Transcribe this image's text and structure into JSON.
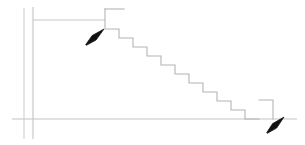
{
  "canvas": {
    "width": 305,
    "height": 145,
    "background": "#ffffff"
  },
  "drawing": {
    "title": "Staircase section line drawing",
    "line_color": "#c8c8c8",
    "line_color_dark": "#b4b4b4",
    "arrow_color": "#111111",
    "line_width": 1,
    "description": "Thin grey architectural section showing a stair flight descending left to right, with two solid black pointer arrows"
  },
  "guides": {
    "vertical_left": {
      "x": 24,
      "y1": 8,
      "y2": 139,
      "color": "#cfcfcf"
    },
    "vertical_right": {
      "x": 33,
      "y1": 7,
      "y2": 139,
      "color": "#c4c4c4"
    },
    "baseline": {
      "x1": 12,
      "x2": 297,
      "y": 119,
      "color": "#c4c4c4"
    },
    "landing_line": {
      "x1": 33,
      "x2": 105,
      "y": 20,
      "color": "#c8c8c8"
    }
  },
  "stair": {
    "step_count": 11,
    "tread_width": 14,
    "riser_height": 9,
    "top_landing": {
      "x1": 105,
      "x2": 124,
      "y": 9
    },
    "top_riser": {
      "x": 105,
      "y1": 9,
      "y2": 29
    },
    "start": {
      "x": 105,
      "y": 29
    },
    "end": {
      "x": 273,
      "y": 119
    },
    "points": [
      [
        105,
        9
      ],
      [
        124,
        9
      ],
      [
        105,
        9
      ],
      [
        105,
        29
      ],
      [
        119,
        29
      ],
      [
        119,
        38
      ],
      [
        133,
        38
      ],
      [
        133,
        47
      ],
      [
        147,
        47
      ],
      [
        147,
        56
      ],
      [
        161,
        56
      ],
      [
        161,
        64
      ],
      [
        175,
        64
      ],
      [
        175,
        73
      ],
      [
        189,
        73
      ],
      [
        189,
        82
      ],
      [
        203,
        82
      ],
      [
        203,
        91
      ],
      [
        217,
        91
      ],
      [
        217,
        100
      ],
      [
        231,
        100
      ],
      [
        231,
        109
      ],
      [
        245,
        109
      ],
      [
        245,
        119
      ],
      [
        273,
        119
      ]
    ],
    "lower_return": {
      "x": 273,
      "y1": 100,
      "y2": 119
    },
    "lower_tread": {
      "x1": 259,
      "x2": 273,
      "y": 100
    }
  },
  "annotations": [
    {
      "id": "arrow-top",
      "name": "upper-callout-arrow",
      "tip": {
        "x": 104,
        "y": 29
      },
      "tail": {
        "x": 86,
        "y": 45
      },
      "direction": "up-right",
      "color": "#111111"
    },
    {
      "id": "arrow-bottom",
      "name": "lower-callout-arrow",
      "tip": {
        "x": 284,
        "y": 117
      },
      "tail": {
        "x": 267,
        "y": 133
      },
      "direction": "up-right",
      "color": "#111111"
    }
  ]
}
